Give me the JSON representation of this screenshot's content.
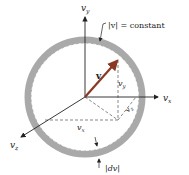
{
  "diagram": {
    "title": "",
    "axes": {
      "vy_label": "v",
      "vy_sub": "y",
      "vx_label": "v",
      "vx_sub": "x",
      "vz_label": "v",
      "vz_sub": "z"
    },
    "vector_label": "v",
    "component_labels": {
      "vy": {
        "main": "v",
        "sub": "y"
      },
      "vz": {
        "main": "v",
        "sub": "z"
      },
      "vx": {
        "main": "v",
        "sub": "x"
      }
    },
    "annotations": {
      "constant": "|v| = constant",
      "dv": "|dv|"
    },
    "colors": {
      "ring_fill": "#a9a9a9",
      "vector": "#8a3a22",
      "axes": "#222222",
      "dashed": "#555555"
    }
  }
}
